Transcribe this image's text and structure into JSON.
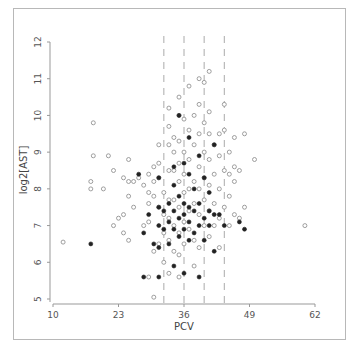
{
  "chart_data": {
    "type": "scatter",
    "title": "",
    "xlabel": "PCV",
    "ylabel": "log2[AST]",
    "xlim": [
      10,
      62
    ],
    "ylim": [
      5,
      12
    ],
    "xticks": [
      10,
      23,
      36,
      49,
      62
    ],
    "yticks": [
      5,
      6,
      7,
      8,
      9,
      10,
      11,
      12
    ],
    "grid": false,
    "legend": null,
    "vlines": [
      32,
      36,
      40,
      44
    ],
    "vline_style": "dashed",
    "series": [
      {
        "name": "open",
        "marker": "open-circle",
        "color": "#888888",
        "points": [
          [
            12,
            6.55
          ],
          [
            18,
            9.8
          ],
          [
            18,
            8.9
          ],
          [
            17.5,
            8.2
          ],
          [
            17.5,
            8.0
          ],
          [
            20,
            8.0
          ],
          [
            21,
            8.9
          ],
          [
            22,
            8.5
          ],
          [
            24,
            8.3
          ],
          [
            25,
            8.8
          ],
          [
            25,
            8.2
          ],
          [
            25,
            7.8
          ],
          [
            26,
            8.2
          ],
          [
            24,
            7.3
          ],
          [
            22,
            7.0
          ],
          [
            23,
            7.2
          ],
          [
            24,
            6.8
          ],
          [
            25,
            6.6
          ],
          [
            26,
            7.5
          ],
          [
            27,
            8.3
          ],
          [
            28,
            8.1
          ],
          [
            28,
            7.0
          ],
          [
            29,
            8.4
          ],
          [
            29,
            7.9
          ],
          [
            29,
            7.6
          ],
          [
            29,
            7.1
          ],
          [
            30,
            8.6
          ],
          [
            30,
            8.2
          ],
          [
            30,
            7.8
          ],
          [
            31,
            9.2
          ],
          [
            31,
            8.7
          ],
          [
            31,
            8.3
          ],
          [
            31,
            7.5
          ],
          [
            31,
            6.5
          ],
          [
            30,
            6.3
          ],
          [
            29,
            5.6
          ],
          [
            30,
            5.05
          ],
          [
            32,
            7.9
          ],
          [
            32,
            7.3
          ],
          [
            32,
            6.8
          ],
          [
            32,
            6.0
          ],
          [
            33,
            10.2
          ],
          [
            33,
            9.7
          ],
          [
            33,
            9.2
          ],
          [
            33,
            8.5
          ],
          [
            33,
            7.7
          ],
          [
            33,
            7.2
          ],
          [
            33,
            6.6
          ],
          [
            33,
            5.7
          ],
          [
            34,
            9.4
          ],
          [
            34,
            9.0
          ],
          [
            34,
            8.5
          ],
          [
            34,
            7.7
          ],
          [
            34,
            7.0
          ],
          [
            34,
            6.3
          ],
          [
            35,
            10.5
          ],
          [
            35,
            10.0
          ],
          [
            35,
            9.3
          ],
          [
            35,
            8.7
          ],
          [
            35,
            8.2
          ],
          [
            35,
            7.5
          ],
          [
            35,
            6.8
          ],
          [
            35,
            6.2
          ],
          [
            35,
            5.6
          ],
          [
            36,
            9.9
          ],
          [
            36,
            9.0
          ],
          [
            36,
            8.4
          ],
          [
            36,
            7.9
          ],
          [
            36,
            7.1
          ],
          [
            36,
            6.5
          ],
          [
            37,
            10.8
          ],
          [
            37,
            9.6
          ],
          [
            37,
            8.8
          ],
          [
            37,
            8.0
          ],
          [
            37,
            7.4
          ],
          [
            37,
            6.9
          ],
          [
            38,
            10.0
          ],
          [
            38,
            9.2
          ],
          [
            38,
            8.2
          ],
          [
            38,
            7.6
          ],
          [
            38,
            6.6
          ],
          [
            38,
            5.9
          ],
          [
            39,
            11.0
          ],
          [
            39,
            10.3
          ],
          [
            39,
            9.5
          ],
          [
            39,
            8.6
          ],
          [
            39,
            8.0
          ],
          [
            39,
            7.3
          ],
          [
            39,
            6.4
          ],
          [
            40,
            10.9
          ],
          [
            40,
            9.8
          ],
          [
            40,
            9.0
          ],
          [
            40,
            8.3
          ],
          [
            40,
            7.7
          ],
          [
            40,
            7.0
          ],
          [
            41,
            11.2
          ],
          [
            41,
            10.1
          ],
          [
            41,
            9.5
          ],
          [
            41,
            8.8
          ],
          [
            41,
            8.1
          ],
          [
            41,
            7.4
          ],
          [
            41,
            6.7
          ],
          [
            42,
            9.2
          ],
          [
            42,
            8.4
          ],
          [
            42,
            7.6
          ],
          [
            42,
            7.0
          ],
          [
            43,
            9.5
          ],
          [
            43,
            8.9
          ],
          [
            43,
            8.0
          ],
          [
            43,
            7.2
          ],
          [
            43,
            6.4
          ],
          [
            44,
            10.3
          ],
          [
            44,
            9.6
          ],
          [
            44,
            8.5
          ],
          [
            44,
            7.5
          ],
          [
            45,
            9.0
          ],
          [
            45,
            8.4
          ],
          [
            45,
            7.8
          ],
          [
            45,
            7.0
          ],
          [
            46,
            9.4
          ],
          [
            46,
            8.6
          ],
          [
            46,
            8.2
          ],
          [
            46,
            7.3
          ],
          [
            47,
            8.5
          ],
          [
            47,
            7.2
          ],
          [
            48,
            9.5
          ],
          [
            48,
            7.5
          ],
          [
            50,
            8.8
          ],
          [
            60,
            7.0
          ]
        ]
      },
      {
        "name": "filled",
        "marker": "filled-circle",
        "color": "#222222",
        "points": [
          [
            17.5,
            6.5
          ],
          [
            27,
            8.4
          ],
          [
            28,
            6.8
          ],
          [
            28,
            5.6
          ],
          [
            29,
            7.3
          ],
          [
            30,
            6.5
          ],
          [
            31,
            8.3
          ],
          [
            31,
            7.5
          ],
          [
            31,
            7.0
          ],
          [
            31,
            6.4
          ],
          [
            31,
            5.6
          ],
          [
            32,
            7.4
          ],
          [
            32,
            6.9
          ],
          [
            33,
            7.6
          ],
          [
            33,
            7.1
          ],
          [
            33,
            6.5
          ],
          [
            34,
            8.6
          ],
          [
            34,
            8.1
          ],
          [
            34,
            7.4
          ],
          [
            34,
            6.9
          ],
          [
            34,
            5.9
          ],
          [
            35,
            10.0
          ],
          [
            35,
            7.8
          ],
          [
            35,
            7.2
          ],
          [
            35,
            6.7
          ],
          [
            36,
            8.7
          ],
          [
            36,
            7.6
          ],
          [
            36,
            7.3
          ],
          [
            36,
            6.9
          ],
          [
            36,
            5.7
          ],
          [
            37,
            9.4
          ],
          [
            37,
            8.4
          ],
          [
            37,
            7.5
          ],
          [
            37,
            7.1
          ],
          [
            37,
            6.6
          ],
          [
            38,
            8.0
          ],
          [
            38,
            7.4
          ],
          [
            38,
            6.8
          ],
          [
            39,
            8.9
          ],
          [
            39,
            7.6
          ],
          [
            39,
            7.0
          ],
          [
            39,
            5.6
          ],
          [
            40,
            8.3
          ],
          [
            40,
            7.2
          ],
          [
            40,
            6.6
          ],
          [
            41,
            7.9
          ],
          [
            41,
            7.4
          ],
          [
            41,
            7.0
          ],
          [
            42,
            9.2
          ],
          [
            42,
            7.3
          ],
          [
            42,
            6.3
          ],
          [
            43,
            7.3
          ],
          [
            44,
            7.0
          ],
          [
            47,
            7.1
          ],
          [
            48,
            6.9
          ]
        ]
      }
    ]
  }
}
